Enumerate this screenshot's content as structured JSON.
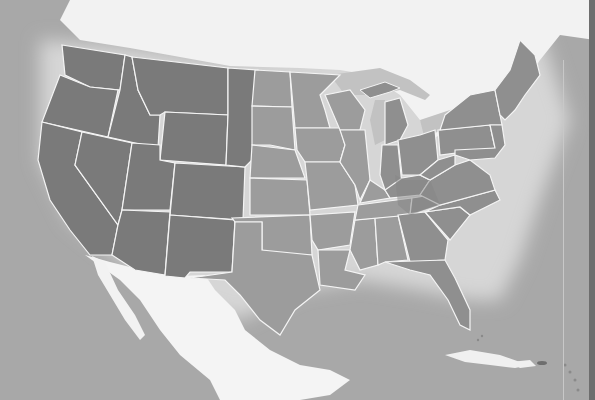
{
  "map": {
    "type": "thematic-map",
    "region": "United States (contiguous) with surrounding land and ocean",
    "colors": {
      "ocean": "#a8a8a8",
      "ocean_glow": "#dcdcdc",
      "foreign_land": "#f2f2f2",
      "great_lakes": "#c4c4c4",
      "zone_pacific_mountain": "#7a7a7a",
      "zone_central": "#9c9c9c",
      "zone_eastern": "#8f8f8f",
      "zone_eastern_dark": "#858585",
      "state_border": "#f4f4f4"
    },
    "zones": [
      {
        "name": "western-zone",
        "shade": "dark"
      },
      {
        "name": "central-zone",
        "shade": "light"
      },
      {
        "name": "eastern-zone",
        "shade": "medium"
      }
    ],
    "labels": []
  }
}
